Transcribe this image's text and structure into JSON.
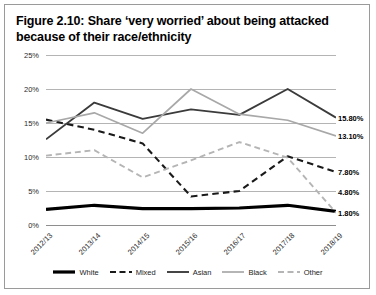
{
  "figure": {
    "title": "Figure 2.10: Share ‘very worried’ about being attacked because of their race/ethnicity"
  },
  "chart_data": {
    "type": "line",
    "title": "Figure 2.10: Share ‘very worried’ about being attacked because of their race/ethnicity",
    "xlabel": "",
    "ylabel": "",
    "ylim": [
      0,
      25
    ],
    "ytick_labels": [
      "0%",
      "5%",
      "10%",
      "15%",
      "20%",
      "25%"
    ],
    "ytick_values": [
      0,
      5,
      10,
      15,
      20,
      25
    ],
    "grid": true,
    "legend_position": "bottom",
    "categories": [
      "2012/13",
      "2013/14",
      "2014/15",
      "2015/16",
      "2016/17",
      "2017/18",
      "2018/19"
    ],
    "series": [
      {
        "name": "White",
        "color": "#000000",
        "style": "solid",
        "width": 3.2,
        "values": [
          2.3,
          2.9,
          2.4,
          2.4,
          2.5,
          2.9,
          2.0
        ],
        "end_label": "4.80%"
      },
      {
        "name": "Mixed",
        "color": "#1a1a1a",
        "style": "dashed",
        "width": 2.1,
        "values": [
          15.5,
          14.0,
          12.0,
          4.2,
          5.0,
          10.1,
          7.8
        ],
        "end_label": "7.80%"
      },
      {
        "name": "Asian",
        "color": "#3b3b3b",
        "style": "solid",
        "width": 1.9,
        "values": [
          12.6,
          18.0,
          15.6,
          17.0,
          16.2,
          20.0,
          15.8
        ],
        "end_label": "15.80%"
      },
      {
        "name": "Black",
        "color": "#a8a8a8",
        "style": "solid",
        "width": 1.7,
        "values": [
          15.0,
          16.5,
          13.5,
          20.0,
          16.3,
          15.4,
          13.1
        ],
        "end_label": "13.10%"
      },
      {
        "name": "Other",
        "color": "#b5b5b5",
        "style": "dashed",
        "width": 1.9,
        "values": [
          10.2,
          11.0,
          7.0,
          9.5,
          12.2,
          9.9,
          1.8
        ],
        "end_label": "1.80%"
      }
    ],
    "end_labels": [
      {
        "text": "15.80%",
        "value": 15.8
      },
      {
        "text": "13.10%",
        "value": 13.1
      },
      {
        "text": "7.80%",
        "value": 7.8
      },
      {
        "text": "1.80%",
        "value": 1.8
      },
      {
        "text": "4.80%",
        "value": 4.8
      }
    ]
  },
  "legend": {
    "items": [
      {
        "label": "White"
      },
      {
        "label": "Mixed"
      },
      {
        "label": "Asian"
      },
      {
        "label": "Black"
      },
      {
        "label": "Other"
      }
    ]
  }
}
